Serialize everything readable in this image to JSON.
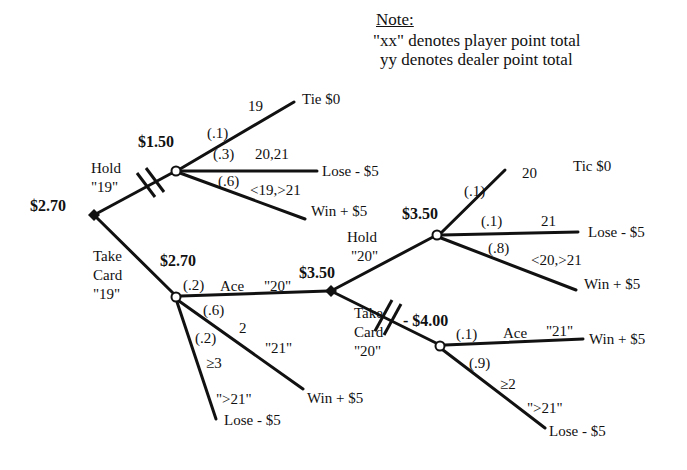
{
  "note": {
    "title": "Note:",
    "lines": [
      "\"xx\" denotes player point total",
      " yy   denotes dealer point total"
    ]
  },
  "nodes": {
    "root": {
      "type": "decision",
      "value": "$2.70",
      "x": 94,
      "y": 215
    },
    "hold19": {
      "type": "chance",
      "value": "$1.50",
      "x": 176,
      "y": 171
    },
    "take19": {
      "type": "chance",
      "value": "$2.70",
      "x": 176,
      "y": 297
    },
    "dec20": {
      "type": "decision",
      "value": "$3.50",
      "x": 331,
      "y": 291
    },
    "hold20": {
      "type": "chance",
      "value": "$3.50",
      "x": 437,
      "y": 235
    },
    "take20": {
      "type": "chance",
      "value": "- $4.00",
      "x": 440,
      "y": 346
    }
  },
  "actions": {
    "hold19": {
      "line1": "Hold",
      "line2": "\"19\""
    },
    "take19": {
      "line1": "Take",
      "line2": "Card",
      "line3": "\"19\""
    },
    "hold20": {
      "line1": "Hold",
      "line2": "\"20\""
    },
    "take20": {
      "line1": "Take",
      "line2": "Card",
      "line3": "\"20\""
    }
  },
  "branches": {
    "hold19": [
      {
        "prob": "(.1)",
        "event": "19",
        "outcome": "Tie $0"
      },
      {
        "prob": "(.3)",
        "event": "20,21",
        "outcome": "Lose - $5"
      },
      {
        "prob": "(.6)",
        "event": "<19,>21",
        "outcome": "Win + $5"
      }
    ],
    "take19": [
      {
        "prob": "(.2)",
        "event": "Ace",
        "total": "\"20\""
      },
      {
        "prob": "(.6)",
        "event": "2",
        "total": "\"21\"",
        "outcome": "Win + $5"
      },
      {
        "prob": "(.2)",
        "event": "≥3",
        "total": "\">21\"",
        "outcome": "Lose - $5"
      }
    ],
    "hold20": [
      {
        "prob": "(.1)",
        "event": "20",
        "outcome": "Tic $0"
      },
      {
        "prob": "(.1)",
        "event": "21",
        "outcome": "Lose - $5"
      },
      {
        "prob": "(.8)",
        "event": "<20,>21",
        "outcome": "Win + $5"
      }
    ],
    "take20": [
      {
        "prob": "(.1)",
        "event": "Ace",
        "total": "\"21\"",
        "outcome": "Win + $5"
      },
      {
        "prob": "(.9)",
        "event": "≥2",
        "total": "\">21\"",
        "outcome": "Lose - $5"
      }
    ]
  },
  "colors": {
    "ink": "#111111",
    "background": "#ffffff"
  }
}
